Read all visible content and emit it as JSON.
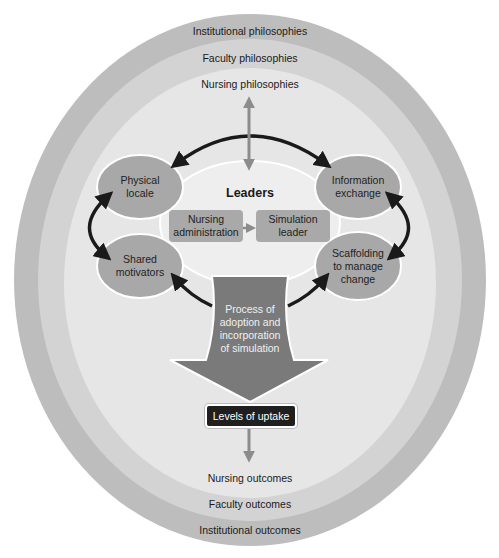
{
  "diagram": {
    "rings": {
      "outer": {
        "top_label": "Institutional philosophies",
        "bottom_label": "Institutional outcomes",
        "color": "#bdbdbd"
      },
      "middle": {
        "top_label": "Faculty philosophies",
        "bottom_label": "Faculty outcomes",
        "color": "#d3d3d3"
      },
      "inner": {
        "top_label": "Nursing philosophies",
        "bottom_label": "Nursing outcomes",
        "color": "#e6e6e6"
      }
    },
    "leaders": {
      "title": "Leaders",
      "nursing_administration": "Nursing administration",
      "nursing_administration_l1": "Nursing",
      "nursing_administration_l2": "administration",
      "simulation_leader_l1": "Simulation",
      "simulation_leader_l2": "leader"
    },
    "factors": {
      "physical_locale_l1": "Physical",
      "physical_locale_l2": "locale",
      "information_exchange_l1": "Information",
      "information_exchange_l2": "exchange",
      "shared_motivators_l1": "Shared",
      "shared_motivators_l2": "motivators",
      "scaffolding_l1": "Scaffolding",
      "scaffolding_l2": "to manage",
      "scaffolding_l3": "change"
    },
    "process": {
      "l1": "Process of",
      "l2": "adoption and",
      "l3": "incorporation",
      "l4": "of simulation"
    },
    "uptake": "Levels of uptake",
    "colors": {
      "bubble": "#a8a8a8",
      "process_arrow": "#7a7a7a",
      "uptake_box": "#1f1f1f",
      "arrow_black": "#1a1a1a",
      "arrow_grey": "#8c8c8c"
    }
  }
}
